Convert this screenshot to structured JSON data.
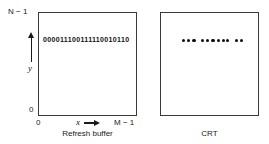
{
  "figure": {
    "background_color": "#ffffff",
    "line_color": "#3a3a3a",
    "dot_color": "#0d0d0d"
  },
  "buffer_panel": {
    "caption": "Refresh buffer",
    "bit_string": "000011100111110010110",
    "axis": {
      "y_max_label": "N − 1",
      "y_min_label": "0",
      "y_axis_name": "y",
      "x_min_label": "0",
      "x_max_label": "M − 1",
      "x_axis_name": "x",
      "y_arrow_icon": "up-arrow-icon",
      "x_arrow_icon": "right-arrow-icon"
    }
  },
  "crt_panel": {
    "caption": "CRT",
    "dot_groups": [
      {
        "count": 3,
        "start_x": 22
      },
      {
        "count": 5,
        "start_x": 41
      },
      {
        "count": 1,
        "start_x": 66
      },
      {
        "count": 2,
        "start_x": 75
      }
    ],
    "dot_spacing": 5.2,
    "group_note": "illuminated pixels correspond to 1 bits in the refresh buffer"
  }
}
